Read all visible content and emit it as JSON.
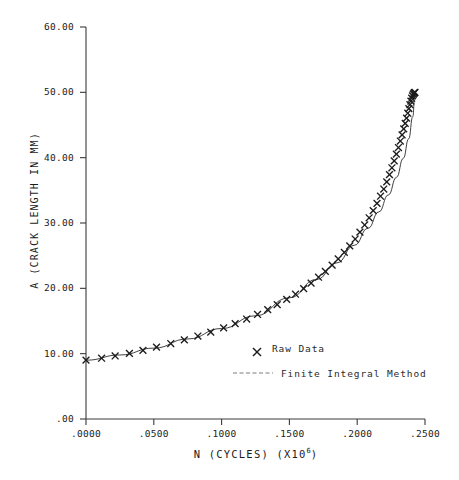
{
  "chart_data": {
    "type": "line",
    "title": "",
    "subtitle": "",
    "xlabel_text": "N (CYCLES) (X10",
    "xlabel_sup": "6",
    "xlabel_tail": ")",
    "xlabel": "N (CYCLES) (X10 6)",
    "ylabel": "A (CRACK LENGTH IN MM)",
    "xlim": [
      0.0,
      0.25
    ],
    "ylim": [
      0.0,
      60.0
    ],
    "grid": false,
    "legend_position": "center-right-lower",
    "xticks": [
      0.0,
      0.05,
      0.1,
      0.15,
      0.2,
      0.25
    ],
    "xtick_labels": [
      ".0000",
      ".0500",
      ".1000",
      ".1500",
      ".2000",
      ".2500"
    ],
    "yticks": [
      0.0,
      10.0,
      20.0,
      30.0,
      40.0,
      50.0,
      60.0
    ],
    "ytick_labels": [
      ".00",
      "10.00",
      "20.00",
      "30.00",
      "40.00",
      "50.00",
      "60.00"
    ],
    "series": [
      {
        "name": "Raw Data",
        "marker": "x",
        "style": "markers",
        "x": [
          0.0,
          0.0115,
          0.0215,
          0.032,
          0.042,
          0.052,
          0.0625,
          0.0725,
          0.0825,
          0.092,
          0.1015,
          0.11,
          0.1185,
          0.1265,
          0.134,
          0.141,
          0.148,
          0.1545,
          0.1605,
          0.166,
          0.1715,
          0.1765,
          0.1815,
          0.186,
          0.1905,
          0.1945,
          0.1985,
          0.202,
          0.2055,
          0.2088,
          0.2118,
          0.2146,
          0.2172,
          0.2196,
          0.2218,
          0.2238,
          0.2256,
          0.2273,
          0.2289,
          0.2304,
          0.2318,
          0.2331,
          0.2343,
          0.2354,
          0.2364,
          0.2373,
          0.2381,
          0.2389,
          0.2396,
          0.2402,
          0.2408,
          0.2413,
          0.2418,
          0.2422,
          0.2426
        ],
        "y": [
          9.0,
          9.3,
          9.65,
          10.05,
          10.5,
          11.0,
          11.55,
          12.1,
          12.7,
          13.3,
          13.95,
          14.6,
          15.3,
          16.0,
          16.75,
          17.5,
          18.3,
          19.1,
          19.95,
          20.8,
          21.7,
          22.6,
          23.55,
          24.5,
          25.5,
          26.5,
          27.55,
          28.6,
          29.7,
          30.8,
          31.9,
          33.0,
          34.1,
          35.2,
          36.3,
          37.4,
          38.45,
          39.5,
          40.55,
          41.55,
          42.55,
          43.5,
          44.4,
          45.25,
          46.05,
          46.8,
          47.5,
          48.1,
          48.65,
          49.1,
          49.45,
          49.7,
          49.85,
          49.95,
          50.0
        ]
      },
      {
        "name": "Finite Integral Method",
        "marker": "none",
        "style": "line",
        "x": [
          0.0,
          0.025,
          0.05,
          0.075,
          0.1,
          0.125,
          0.15,
          0.17,
          0.185,
          0.198,
          0.208,
          0.216,
          0.223,
          0.229,
          0.234,
          0.238,
          0.241,
          0.2426
        ],
        "y": [
          9.0,
          9.8,
          10.85,
          12.25,
          13.85,
          15.8,
          18.55,
          21.35,
          23.9,
          26.6,
          29.2,
          31.7,
          34.3,
          37.0,
          39.9,
          42.9,
          46.3,
          50.0
        ]
      }
    ]
  },
  "legend": {
    "entries": [
      {
        "label": "Raw Data",
        "marker": "x"
      },
      {
        "label": "Finite Integral Method",
        "marker": "line"
      }
    ]
  },
  "colors": {
    "ink": "#1b1b1b",
    "axis": "#3a3a3a",
    "curve": "#2a2a2a",
    "background": "#ffffff"
  }
}
